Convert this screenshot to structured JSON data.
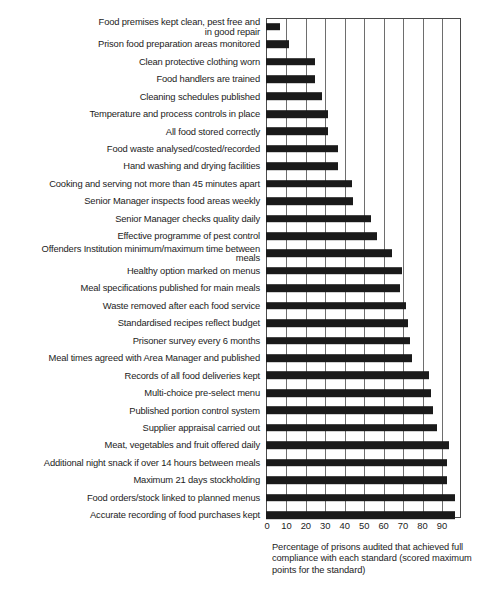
{
  "chart_data": {
    "type": "bar",
    "orientation": "horizontal",
    "title": "",
    "subtitle": "",
    "xlabel": "Percentage of prisons audited that achieved full compliance with each standard (scored maximum points for the standard)",
    "ylabel": "",
    "xlim": [
      0,
      100
    ],
    "xticks": [
      0,
      10,
      20,
      30,
      40,
      50,
      60,
      70,
      80,
      90
    ],
    "xtick_labels": [
      "0",
      "10",
      "20",
      "30",
      "40",
      "50",
      "60",
      "70",
      "80",
      "90"
    ],
    "grid": true,
    "grid_axis": "x",
    "legend": false,
    "bar_color": "#1a1a1a",
    "categories": [
      "Food premises kept clean, pest free and in good repair",
      "Prison food preparation areas monitored",
      "Clean protective clothing worn",
      "Food handlers are trained",
      "Cleaning schedules published",
      "Temperature and process controls in place",
      "All food stored correctly",
      "Food waste analysed/costed/recorded",
      "Hand washing and drying facilities",
      "Cooking and serving not more than 45 minutes apart",
      "Senior Manager inspects food areas weekly",
      "Senior Manager checks quality daily",
      "Effective programme of pest control",
      "Offenders Institution minimum/maximum time between meals",
      "Healthy option marked on menus",
      "Meal specifications published for main meals",
      "Waste removed after each food service",
      "Standardised recipes reflect budget",
      "Prisoner survey every 6 months",
      "Meal times agreed with Area Manager and published",
      "Records of all food deliveries kept",
      "Multi-choice pre-select menu",
      "Published portion control system",
      "Supplier appraisal carried out",
      "Meat, vegetables and fruit offered daily",
      "Additional night snack if over 14 hours between meals",
      "Maximum 21 days stockholding",
      "Food orders/stock linked to planned menus",
      "Accurate recording of food purchases kept"
    ],
    "category_labels_wrapped": [
      "Food premises kept clean, pest free and\nin good repair",
      "Prison food preparation areas monitored",
      "Clean protective clothing worn",
      "Food handlers are trained",
      "Cleaning schedules published",
      "Temperature and process controls in place",
      "All food stored correctly",
      "Food waste analysed/costed/recorded",
      "Hand washing and drying facilities",
      "Cooking and serving not more than 45 minutes apart",
      "Senior Manager inspects food areas weekly",
      "Senior Manager checks quality daily",
      "Effective programme of pest control",
      "Offenders Institution minimum/maximum time between\nmeals",
      "Healthy option marked on menus",
      "Meal specifications published for main meals",
      "Waste removed after each food service",
      "Standardised recipes reflect budget",
      "Prisoner survey every 6 months",
      "Meal times agreed with Area Manager and published",
      "Records of all food deliveries kept",
      "Multi-choice pre-select menu",
      "Published portion control system",
      "Supplier appraisal carried out",
      "Meat, vegetables and fruit offered daily",
      "Additional night snack if over 14 hours between meals",
      "Maximum 21 days stockholding",
      "Food orders/stock linked to planned menus",
      "Accurate recording of food purchases kept"
    ],
    "values": [
      7,
      12,
      25,
      25,
      29,
      32,
      32,
      37,
      37,
      44,
      45,
      54,
      57,
      65,
      70,
      69,
      72,
      73,
      74,
      75,
      84,
      85,
      86,
      88,
      94,
      93,
      93,
      97,
      97
    ]
  }
}
